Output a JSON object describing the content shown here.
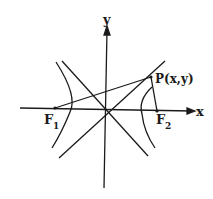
{
  "diagram": {
    "axes": {
      "x_label": "x",
      "y_label": "y"
    },
    "points": {
      "f1": {
        "label": "F",
        "sub": "1"
      },
      "f2": {
        "label": "F",
        "sub": "2"
      },
      "p": {
        "label": "P(x,y)"
      }
    },
    "colors": {
      "ink": "#1a1a1a",
      "background": "#ffffff"
    }
  }
}
